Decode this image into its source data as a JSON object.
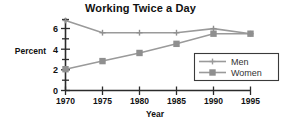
{
  "chart_data": {
    "type": "line",
    "title": "Working Twice a Day",
    "xlabel": "Year",
    "ylabel": "Percent",
    "categories": [
      "1970",
      "1975",
      "1980",
      "1985",
      "1990",
      "1995"
    ],
    "x": [
      1970,
      1975,
      1980,
      1985,
      1990,
      1995
    ],
    "series": [
      {
        "name": "Men",
        "values": [
          6.9,
          5.7,
          5.7,
          5.7,
          6.1,
          5.6
        ],
        "marker": "plus",
        "color": "#9a9a9a"
      },
      {
        "name": "Women",
        "values": [
          2.1,
          2.9,
          3.7,
          4.6,
          5.6,
          5.6
        ],
        "marker": "square",
        "color": "#9a9a9a"
      }
    ],
    "xlim": [
      1970,
      1995
    ],
    "ylim": [
      0,
      7
    ],
    "yticks": [
      0,
      2,
      4,
      6
    ],
    "yticks_minor": [
      1,
      3,
      5,
      7
    ],
    "grid": false,
    "legend_position": "bottom-right",
    "axis_color": "#2b2b2b",
    "line_color": "#9a9a9a",
    "background": "#ffffff"
  },
  "legend": {
    "entries": [
      {
        "label": "Men"
      },
      {
        "label": "Women"
      }
    ]
  },
  "axis": {
    "y_tick_labels": [
      "6",
      "4",
      "2",
      "0"
    ],
    "x_tick_labels": [
      "1970",
      "1975",
      "1980",
      "1985",
      "1990",
      "1995"
    ]
  }
}
